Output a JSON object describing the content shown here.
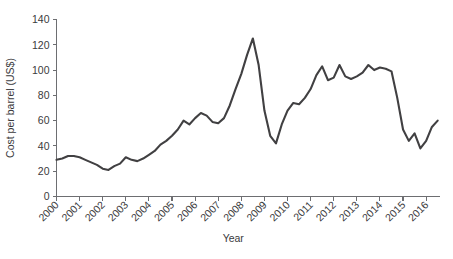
{
  "chart_data": {
    "type": "line",
    "title": "",
    "xlabel": "Year",
    "ylabel": "Cost per barrel (US$)",
    "xlim": [
      2000,
      2016.6
    ],
    "ylim": [
      0,
      140
    ],
    "ytick_values": [
      0,
      20,
      40,
      60,
      80,
      100,
      120,
      140
    ],
    "ytick_labels": [
      "0",
      "20",
      "40",
      "60",
      "80",
      "100",
      "120",
      "140"
    ],
    "xtick_values": [
      2000,
      2001,
      2002,
      2003,
      2004,
      2005,
      2006,
      2007,
      2008,
      2009,
      2010,
      2011,
      2012,
      2013,
      2014,
      2015,
      2016
    ],
    "xtick_labels": [
      "2000",
      "2001",
      "2002",
      "2003",
      "2004",
      "2005",
      "2006",
      "2007",
      "2008",
      "2009",
      "2010",
      "2011",
      "2012",
      "2013",
      "2014",
      "2015",
      "2016"
    ],
    "grid": false,
    "legend": false,
    "line_color": "#414042",
    "axis_color": "#6d6e71",
    "series": [
      {
        "name": "Cost per barrel (US$)",
        "x": [
          2000.0,
          2000.25,
          2000.5,
          2000.75,
          2001.0,
          2001.25,
          2001.5,
          2001.75,
          2002.0,
          2002.25,
          2002.5,
          2002.75,
          2003.0,
          2003.25,
          2003.5,
          2003.75,
          2004.0,
          2004.25,
          2004.5,
          2004.75,
          2005.0,
          2005.25,
          2005.5,
          2005.75,
          2006.0,
          2006.25,
          2006.5,
          2006.75,
          2007.0,
          2007.25,
          2007.5,
          2007.75,
          2008.0,
          2008.25,
          2008.5,
          2008.75,
          2009.0,
          2009.25,
          2009.5,
          2009.75,
          2010.0,
          2010.25,
          2010.5,
          2010.75,
          2011.0,
          2011.25,
          2011.5,
          2011.75,
          2012.0,
          2012.25,
          2012.5,
          2012.75,
          2013.0,
          2013.25,
          2013.5,
          2013.75,
          2014.0,
          2014.25,
          2014.5,
          2014.75,
          2015.0,
          2015.25,
          2015.5,
          2015.75,
          2016.0,
          2016.25,
          2016.5
        ],
        "values": [
          29,
          30,
          32,
          32,
          31,
          29,
          27,
          25,
          22,
          21,
          24,
          26,
          31,
          29,
          28,
          30,
          33,
          36,
          41,
          44,
          48,
          53,
          60,
          57,
          62,
          66,
          64,
          59,
          58,
          62,
          72,
          85,
          97,
          112,
          125,
          104,
          68,
          48,
          42,
          57,
          68,
          74,
          73,
          78,
          85,
          96,
          103,
          92,
          94,
          104,
          95,
          93,
          95,
          98,
          104,
          100,
          102,
          101,
          99,
          78,
          53,
          44,
          50,
          38,
          44,
          55,
          60
        ]
      }
    ]
  }
}
